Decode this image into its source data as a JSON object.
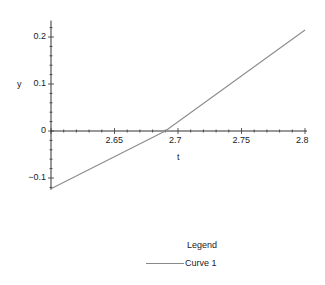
{
  "chart_data": {
    "type": "line",
    "title": "",
    "xlabel": "t",
    "ylabel": "y",
    "xlim": [
      2.6,
      2.8
    ],
    "ylim": [
      -0.125,
      0.235
    ],
    "x_ticks": [
      "2.65",
      "2.7",
      "2.75",
      "2.8"
    ],
    "x_tick_values": [
      2.65,
      2.7,
      2.75,
      2.8
    ],
    "y_ticks": [
      "0.2",
      "0.1",
      "0",
      "-0.1"
    ],
    "y_tick_values": [
      0.2,
      0.1,
      0,
      -0.1
    ],
    "grid": false,
    "legend_position": "bottom",
    "series": [
      {
        "name": "Curve 1",
        "color": "#8c8c8c",
        "x": [
          2.6,
          2.69,
          2.8
        ],
        "y": [
          -0.123,
          0.0,
          0.215
        ]
      }
    ]
  },
  "legend": {
    "title": "Legend",
    "items": [
      {
        "label": "Curve 1"
      }
    ]
  },
  "axis_labels": {
    "x": "t",
    "y": "y",
    "y_neg_tick": "−0.1"
  }
}
